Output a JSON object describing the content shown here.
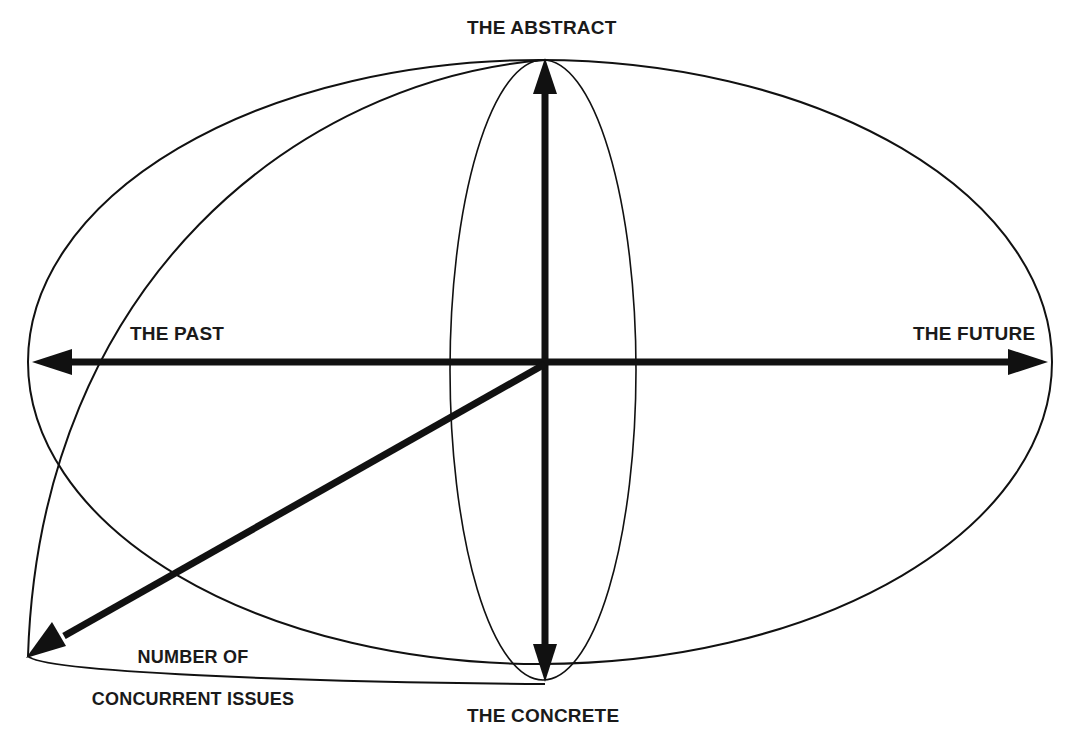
{
  "diagram": {
    "type": "conceptual-axes",
    "stroke_color": "#111111",
    "background_color": "#ffffff",
    "labels": {
      "top": "THE ABSTRACT",
      "bottom": "THE CONCRETE",
      "left": "THE PAST",
      "right": "THE FUTURE",
      "diagonal_line1": "NUMBER OF",
      "diagonal_line2": "CONCURRENT ISSUES"
    },
    "axes": [
      {
        "name": "abstract-concrete",
        "direction": "vertical",
        "from": "THE CONCRETE",
        "to": "THE ABSTRACT",
        "bidirectional": true
      },
      {
        "name": "past-future",
        "direction": "horizontal",
        "from": "THE PAST",
        "to": "THE FUTURE",
        "bidirectional": true
      },
      {
        "name": "concurrent-issues",
        "direction": "diagonal-down-left",
        "to": "NUMBER OF CONCURRENT ISSUES",
        "bidirectional": false
      }
    ],
    "shapes": [
      {
        "name": "outer-ellipse",
        "kind": "ellipse"
      },
      {
        "name": "inner-vertical-ellipse",
        "kind": "ellipse"
      },
      {
        "name": "depth-curve",
        "kind": "curve"
      }
    ]
  }
}
